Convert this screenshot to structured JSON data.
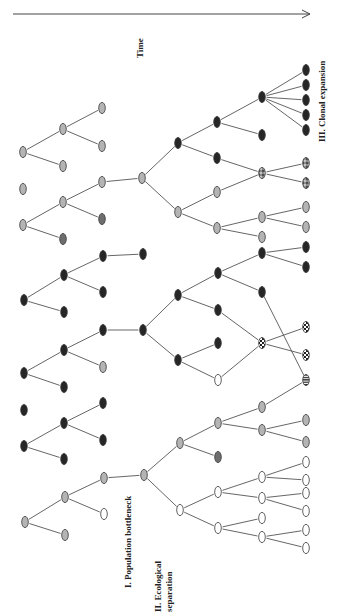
{
  "figure": {
    "orientation": "rotated -90deg",
    "labels": {
      "time": "Time",
      "stage1": "I. Population bottleneck",
      "stage2_line1": "II. Ecological",
      "stage2_line2": "separation",
      "stage3": "III. Clonal expansion"
    },
    "colors": {
      "gray": "#b4b4b4",
      "darkgray": "#6e6e6e",
      "dark": "#262626",
      "white": "#ffffff",
      "edge": "#555555"
    },
    "time_arrow": {
      "x1": 13,
      "y1": 14,
      "x2": 310,
      "y2": 14
    },
    "nodes": [
      {
        "id": "a1",
        "x": 23,
        "y": 152,
        "c": "gray"
      },
      {
        "id": "b1",
        "x": 63,
        "y": 129,
        "c": "gray"
      },
      {
        "id": "b2",
        "x": 63,
        "y": 166,
        "c": "gray"
      },
      {
        "id": "c1",
        "x": 102,
        "y": 108,
        "c": "gray"
      },
      {
        "id": "c2",
        "x": 102,
        "y": 146,
        "c": "gray"
      },
      {
        "id": "a2",
        "x": 23,
        "y": 189,
        "c": "gray"
      },
      {
        "id": "a3",
        "x": 23,
        "y": 225,
        "c": "gray"
      },
      {
        "id": "b3",
        "x": 63,
        "y": 202,
        "c": "gray"
      },
      {
        "id": "b4",
        "x": 63,
        "y": 239,
        "c": "darkgray"
      },
      {
        "id": "c3",
        "x": 102,
        "y": 182,
        "c": "gray"
      },
      {
        "id": "c4",
        "x": 102,
        "y": 219,
        "c": "darkgray"
      },
      {
        "id": "d1",
        "x": 142,
        "y": 178,
        "c": "gray"
      },
      {
        "id": "a4",
        "x": 24,
        "y": 300,
        "c": "dark"
      },
      {
        "id": "b5",
        "x": 64,
        "y": 275,
        "c": "dark"
      },
      {
        "id": "b6",
        "x": 64,
        "y": 312,
        "c": "dark"
      },
      {
        "id": "c5",
        "x": 103,
        "y": 256,
        "c": "dark"
      },
      {
        "id": "c6",
        "x": 103,
        "y": 292,
        "c": "dark"
      },
      {
        "id": "d2",
        "x": 143,
        "y": 254,
        "c": "dark"
      },
      {
        "id": "a5",
        "x": 24,
        "y": 373,
        "c": "dark"
      },
      {
        "id": "b7",
        "x": 64,
        "y": 350,
        "c": "dark"
      },
      {
        "id": "b8",
        "x": 64,
        "y": 387,
        "c": "dark"
      },
      {
        "id": "c7",
        "x": 103,
        "y": 330,
        "c": "dark"
      },
      {
        "id": "c8",
        "x": 103,
        "y": 367,
        "c": "gray"
      },
      {
        "id": "d3",
        "x": 143,
        "y": 330,
        "c": "dark"
      },
      {
        "id": "a6",
        "x": 24,
        "y": 410,
        "c": "dark"
      },
      {
        "id": "a7",
        "x": 24,
        "y": 446,
        "c": "dark"
      },
      {
        "id": "b9",
        "x": 64,
        "y": 423,
        "c": "dark"
      },
      {
        "id": "b10",
        "x": 64,
        "y": 459,
        "c": "dark"
      },
      {
        "id": "c9",
        "x": 103,
        "y": 403,
        "c": "dark"
      },
      {
        "id": "c10",
        "x": 103,
        "y": 440,
        "c": "dark"
      },
      {
        "id": "a8",
        "x": 25,
        "y": 522,
        "c": "gray"
      },
      {
        "id": "b11",
        "x": 65,
        "y": 497,
        "c": "gray"
      },
      {
        "id": "b12",
        "x": 65,
        "y": 535,
        "c": "gray"
      },
      {
        "id": "c11",
        "x": 104,
        "y": 478,
        "c": "gray"
      },
      {
        "id": "c12",
        "x": 104,
        "y": 514,
        "c": "white"
      },
      {
        "id": "d4",
        "x": 144,
        "y": 475,
        "c": "gray"
      },
      {
        "id": "e1",
        "x": 178,
        "y": 143,
        "c": "dark"
      },
      {
        "id": "e2",
        "x": 178,
        "y": 212,
        "c": "gray"
      },
      {
        "id": "f1",
        "x": 217,
        "y": 122,
        "c": "dark"
      },
      {
        "id": "f2",
        "x": 217,
        "y": 158,
        "c": "dark"
      },
      {
        "id": "f3",
        "x": 217,
        "y": 192,
        "c": "gray"
      },
      {
        "id": "f4",
        "x": 217,
        "y": 228,
        "c": "gray"
      },
      {
        "id": "g1",
        "x": 262,
        "y": 97,
        "c": "dark"
      },
      {
        "id": "g2",
        "x": 262,
        "y": 135,
        "c": "dark"
      },
      {
        "id": "g3",
        "x": 262,
        "y": 173,
        "c": "dots"
      },
      {
        "id": "g4",
        "x": 262,
        "y": 217,
        "c": "gray"
      },
      {
        "id": "g5",
        "x": 262,
        "y": 237,
        "c": "gray"
      },
      {
        "id": "h1",
        "x": 306,
        "y": 70,
        "c": "dark"
      },
      {
        "id": "h2",
        "x": 306,
        "y": 85,
        "c": "dark"
      },
      {
        "id": "h3",
        "x": 306,
        "y": 100,
        "c": "dark"
      },
      {
        "id": "h4",
        "x": 306,
        "y": 115,
        "c": "dark"
      },
      {
        "id": "h5",
        "x": 306,
        "y": 130,
        "c": "dark"
      },
      {
        "id": "h6",
        "x": 306,
        "y": 163,
        "c": "dots"
      },
      {
        "id": "h7",
        "x": 306,
        "y": 183,
        "c": "dots"
      },
      {
        "id": "h8",
        "x": 306,
        "y": 207,
        "c": "gray"
      },
      {
        "id": "h9",
        "x": 306,
        "y": 227,
        "c": "gray"
      },
      {
        "id": "e3",
        "x": 178,
        "y": 295,
        "c": "dark"
      },
      {
        "id": "e4",
        "x": 178,
        "y": 360,
        "c": "dark"
      },
      {
        "id": "f5",
        "x": 218,
        "y": 273,
        "c": "dark"
      },
      {
        "id": "f6",
        "x": 218,
        "y": 310,
        "c": "dark"
      },
      {
        "id": "f7",
        "x": 218,
        "y": 343,
        "c": "dark"
      },
      {
        "id": "f8",
        "x": 218,
        "y": 380,
        "c": "white"
      },
      {
        "id": "g6",
        "x": 262,
        "y": 253,
        "c": "dark"
      },
      {
        "id": "g7",
        "x": 262,
        "y": 292,
        "c": "dark"
      },
      {
        "id": "g8",
        "x": 262,
        "y": 343,
        "c": "checker"
      },
      {
        "id": "h10",
        "x": 306,
        "y": 247,
        "c": "dark"
      },
      {
        "id": "h11",
        "x": 306,
        "y": 267,
        "c": "dark"
      },
      {
        "id": "h12",
        "x": 306,
        "y": 327,
        "c": "checker"
      },
      {
        "id": "h13",
        "x": 306,
        "y": 355,
        "c": "checker"
      },
      {
        "id": "h14",
        "x": 306,
        "y": 380,
        "c": "stripes"
      },
      {
        "id": "e5",
        "x": 180,
        "y": 443,
        "c": "gray"
      },
      {
        "id": "e6",
        "x": 180,
        "y": 510,
        "c": "white"
      },
      {
        "id": "f9",
        "x": 218,
        "y": 423,
        "c": "gray"
      },
      {
        "id": "f10",
        "x": 218,
        "y": 457,
        "c": "darkgray"
      },
      {
        "id": "f11",
        "x": 218,
        "y": 492,
        "c": "white"
      },
      {
        "id": "f12",
        "x": 218,
        "y": 528,
        "c": "white"
      },
      {
        "id": "g9",
        "x": 262,
        "y": 407,
        "c": "gray"
      },
      {
        "id": "g10",
        "x": 262,
        "y": 430,
        "c": "gray"
      },
      {
        "id": "g11",
        "x": 262,
        "y": 477,
        "c": "white"
      },
      {
        "id": "g12",
        "x": 262,
        "y": 498,
        "c": "white"
      },
      {
        "id": "g13",
        "x": 262,
        "y": 518,
        "c": "white"
      },
      {
        "id": "g14",
        "x": 262,
        "y": 537,
        "c": "white"
      },
      {
        "id": "h15",
        "x": 306,
        "y": 420,
        "c": "gray"
      },
      {
        "id": "h16",
        "x": 306,
        "y": 442,
        "c": "gray"
      },
      {
        "id": "h17",
        "x": 306,
        "y": 462,
        "c": "white"
      },
      {
        "id": "h18",
        "x": 306,
        "y": 480,
        "c": "white"
      },
      {
        "id": "h19",
        "x": 306,
        "y": 493,
        "c": "white"
      },
      {
        "id": "h20",
        "x": 306,
        "y": 511,
        "c": "white"
      },
      {
        "id": "h21",
        "x": 306,
        "y": 530,
        "c": "white"
      },
      {
        "id": "h22",
        "x": 306,
        "y": 548,
        "c": "white"
      }
    ],
    "edges": [
      [
        "a1",
        "b1"
      ],
      [
        "a1",
        "b2"
      ],
      [
        "b1",
        "c1"
      ],
      [
        "b1",
        "c2"
      ],
      [
        "a3",
        "b3"
      ],
      [
        "a3",
        "b4"
      ],
      [
        "b3",
        "c3"
      ],
      [
        "b3",
        "c4"
      ],
      [
        "c3",
        "d1"
      ],
      [
        "a4",
        "b5"
      ],
      [
        "a4",
        "b6"
      ],
      [
        "b5",
        "c5"
      ],
      [
        "b5",
        "c6"
      ],
      [
        "c5",
        "d2"
      ],
      [
        "a5",
        "b7"
      ],
      [
        "a5",
        "b8"
      ],
      [
        "b7",
        "c7"
      ],
      [
        "b7",
        "c8"
      ],
      [
        "c7",
        "d3"
      ],
      [
        "a7",
        "b9"
      ],
      [
        "a7",
        "b10"
      ],
      [
        "b9",
        "c9"
      ],
      [
        "b9",
        "c10"
      ],
      [
        "a8",
        "b11"
      ],
      [
        "a8",
        "b12"
      ],
      [
        "b11",
        "c11"
      ],
      [
        "b11",
        "c12"
      ],
      [
        "c11",
        "d4"
      ],
      [
        "d1",
        "e1"
      ],
      [
        "d1",
        "e2"
      ],
      [
        "e1",
        "f1"
      ],
      [
        "e1",
        "f2"
      ],
      [
        "f1",
        "g1"
      ],
      [
        "f1",
        "g2"
      ],
      [
        "g1",
        "h1"
      ],
      [
        "g1",
        "h2"
      ],
      [
        "g1",
        "h3"
      ],
      [
        "g1",
        "h4"
      ],
      [
        "g1",
        "h5"
      ],
      [
        "f2",
        "g3"
      ],
      [
        "f3",
        "g3"
      ],
      [
        "g3",
        "h6"
      ],
      [
        "g3",
        "h7"
      ],
      [
        "e2",
        "f3"
      ],
      [
        "e2",
        "f4"
      ],
      [
        "f4",
        "g4"
      ],
      [
        "f4",
        "g5"
      ],
      [
        "g4",
        "h8"
      ],
      [
        "g4",
        "h9"
      ],
      [
        "d3",
        "e3"
      ],
      [
        "d3",
        "e4"
      ],
      [
        "e3",
        "f5"
      ],
      [
        "e3",
        "f6"
      ],
      [
        "f5",
        "g6"
      ],
      [
        "f5",
        "g7"
      ],
      [
        "g6",
        "h10"
      ],
      [
        "g6",
        "h11"
      ],
      [
        "g7",
        "h14"
      ],
      [
        "f6",
        "g8"
      ],
      [
        "f8",
        "g8"
      ],
      [
        "e4",
        "f7"
      ],
      [
        "e4",
        "f8"
      ],
      [
        "g8",
        "h12"
      ],
      [
        "g8",
        "h13"
      ],
      [
        "d4",
        "e5"
      ],
      [
        "d4",
        "e6"
      ],
      [
        "e5",
        "f9"
      ],
      [
        "e5",
        "f10"
      ],
      [
        "f9",
        "g9"
      ],
      [
        "f9",
        "g10"
      ],
      [
        "g9",
        "h14"
      ],
      [
        "g10",
        "h15"
      ],
      [
        "g10",
        "h16"
      ],
      [
        "e6",
        "f11"
      ],
      [
        "e6",
        "f12"
      ],
      [
        "f11",
        "g11"
      ],
      [
        "f11",
        "g12"
      ],
      [
        "f12",
        "g13"
      ],
      [
        "f12",
        "g14"
      ],
      [
        "g11",
        "h17"
      ],
      [
        "g11",
        "h18"
      ],
      [
        "g12",
        "h19"
      ],
      [
        "g12",
        "h20"
      ],
      [
        "g14",
        "h21"
      ],
      [
        "g14",
        "h22"
      ]
    ]
  }
}
